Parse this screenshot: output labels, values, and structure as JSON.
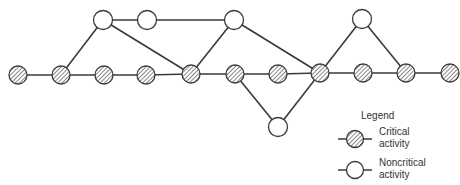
{
  "diagram": {
    "type": "activity-network",
    "colors": {
      "line": "#3a3a3a",
      "hatch": "#555555",
      "node_fill": "#ffffff"
    },
    "nodes": [
      {
        "id": "n1",
        "x": 18,
        "y": 75,
        "kind": "critical"
      },
      {
        "id": "n2",
        "x": 61,
        "y": 75,
        "kind": "critical"
      },
      {
        "id": "n3",
        "x": 104,
        "y": 75,
        "kind": "critical"
      },
      {
        "id": "n4",
        "x": 146,
        "y": 75,
        "kind": "critical"
      },
      {
        "id": "n5",
        "x": 191,
        "y": 74,
        "kind": "critical"
      },
      {
        "id": "n6",
        "x": 235,
        "y": 74,
        "kind": "critical"
      },
      {
        "id": "n7",
        "x": 278,
        "y": 74,
        "kind": "critical"
      },
      {
        "id": "n8",
        "x": 320,
        "y": 73,
        "kind": "critical"
      },
      {
        "id": "n9",
        "x": 363,
        "y": 73,
        "kind": "critical"
      },
      {
        "id": "n10",
        "x": 406,
        "y": 73,
        "kind": "critical"
      },
      {
        "id": "n11",
        "x": 450,
        "y": 73,
        "kind": "critical"
      },
      {
        "id": "t1",
        "x": 103,
        "y": 20,
        "kind": "noncritical"
      },
      {
        "id": "t2",
        "x": 147,
        "y": 20,
        "kind": "noncritical"
      },
      {
        "id": "t3",
        "x": 234,
        "y": 20,
        "kind": "noncritical"
      },
      {
        "id": "t4",
        "x": 362,
        "y": 19,
        "kind": "noncritical"
      },
      {
        "id": "b1",
        "x": 278,
        "y": 127,
        "kind": "noncritical"
      }
    ],
    "edges": [
      [
        "n1",
        "n2"
      ],
      [
        "n2",
        "n3"
      ],
      [
        "n3",
        "n4"
      ],
      [
        "n4",
        "n5"
      ],
      [
        "n5",
        "n6"
      ],
      [
        "n6",
        "n7"
      ],
      [
        "n7",
        "n8"
      ],
      [
        "n8",
        "n9"
      ],
      [
        "n9",
        "n10"
      ],
      [
        "n10",
        "n11"
      ],
      [
        "n2",
        "t1"
      ],
      [
        "t1",
        "t2"
      ],
      [
        "t2",
        "t3"
      ],
      [
        "t1",
        "n5"
      ],
      [
        "n5",
        "t3"
      ],
      [
        "t3",
        "n8"
      ],
      [
        "n6",
        "b1"
      ],
      [
        "b1",
        "n8"
      ],
      [
        "n8",
        "t4"
      ],
      [
        "t4",
        "n10"
      ]
    ]
  },
  "legend": {
    "title": "Legend",
    "items": [
      {
        "kind": "critical",
        "line1": "Critical",
        "line2": "activity"
      },
      {
        "kind": "noncritical",
        "line1": "Noncritical",
        "line2": "activity"
      }
    ]
  }
}
